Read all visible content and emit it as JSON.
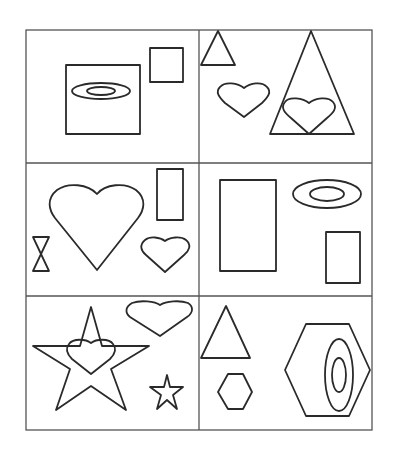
{
  "puzzle": {
    "type": "shape-matching-grid",
    "rows": 3,
    "cols": 2,
    "line_color": "#555555",
    "shape_color": "#2a2a2a",
    "cells": [
      {
        "position": "row1-col1",
        "shapes": [
          "square-large",
          "ellipse-outer",
          "ellipse-inner",
          "square-small"
        ]
      },
      {
        "position": "row1-col2",
        "shapes": [
          "triangle-small",
          "heart-small",
          "triangle-large",
          "heart-in-triangle"
        ]
      },
      {
        "position": "row2-col1",
        "shapes": [
          "heart-large",
          "rectangle-tall",
          "hourglass",
          "heart-small"
        ]
      },
      {
        "position": "row2-col2",
        "shapes": [
          "rectangle-large",
          "ellipse-outer",
          "ellipse-inner",
          "rectangle-small"
        ]
      },
      {
        "position": "row3-col1",
        "shapes": [
          "star-large",
          "heart-in-star",
          "heart-top-right",
          "star-small"
        ]
      },
      {
        "position": "row3-col2",
        "shapes": [
          "triangle",
          "hexagon-small",
          "hexagon-large",
          "ellipse-outer-vertical",
          "ellipse-inner-vertical"
        ]
      }
    ]
  }
}
